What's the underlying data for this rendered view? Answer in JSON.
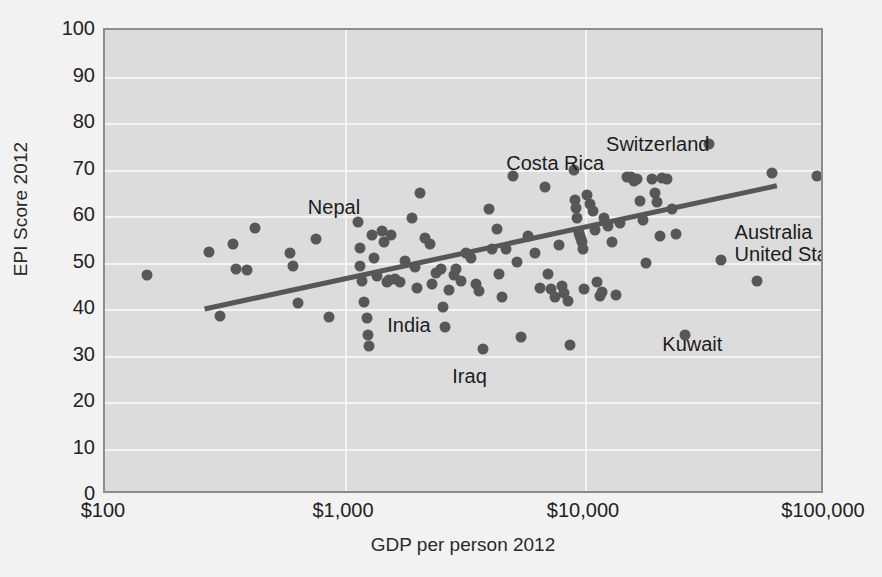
{
  "chart_data": {
    "type": "scatter",
    "title": "",
    "xlabel": "GDP per person 2012",
    "ylabel": "EPI Score 2012",
    "xscale": "log",
    "xlim": [
      100,
      100000
    ],
    "ylim": [
      0,
      100
    ],
    "grid": true,
    "legend": null,
    "xticks": [
      "$100",
      "$1,000",
      "$10,000",
      "$100,000"
    ],
    "xtick_values": [
      100,
      1000,
      10000,
      100000
    ],
    "yticks": [
      "0",
      "10",
      "20",
      "30",
      "40",
      "50",
      "60",
      "70",
      "80",
      "90",
      "100"
    ],
    "ytick_values": [
      0,
      10,
      20,
      30,
      40,
      50,
      60,
      70,
      80,
      90,
      100
    ],
    "marker_color": "#575757",
    "plot_background": "#dcdcdc",
    "gridline_color": "#f4f4f4",
    "trendline": {
      "color": "#575757",
      "x": [
        260,
        63000
      ],
      "y": [
        40.0,
        66.5
      ]
    },
    "annotations": [
      {
        "label": "Nepal",
        "x": 700,
        "y": 62.0,
        "align": "left"
      },
      {
        "label": "Costa Rica",
        "x": 4700,
        "y": 71.5,
        "align": "left"
      },
      {
        "label": "Switzerland",
        "x": 33000,
        "y": 75.5,
        "align": "right"
      },
      {
        "label": "Australia",
        "x": 42000,
        "y": 56.5,
        "align": "left"
      },
      {
        "label": "United States",
        "x": 42000,
        "y": 51.8,
        "align": "left"
      },
      {
        "label": "India",
        "x": 1500,
        "y": 36.5,
        "align": "left"
      },
      {
        "label": "Iraq",
        "x": 2800,
        "y": 25.5,
        "align": "left"
      },
      {
        "label": "Kuwait",
        "x": 21000,
        "y": 32.5,
        "align": "left"
      }
    ],
    "points": [
      {
        "x": 150,
        "y": 47.3
      },
      {
        "x": 270,
        "y": 52.3
      },
      {
        "x": 300,
        "y": 38.5
      },
      {
        "x": 340,
        "y": 54.0
      },
      {
        "x": 350,
        "y": 48.5
      },
      {
        "x": 390,
        "y": 48.3
      },
      {
        "x": 420,
        "y": 57.5
      },
      {
        "x": 590,
        "y": 52.0
      },
      {
        "x": 610,
        "y": 49.3
      },
      {
        "x": 640,
        "y": 41.2
      },
      {
        "x": 760,
        "y": 55.0
      },
      {
        "x": 860,
        "y": 38.3
      },
      {
        "x": 1130,
        "y": 58.7
      },
      {
        "x": 1150,
        "y": 53.1
      },
      {
        "x": 1160,
        "y": 49.2
      },
      {
        "x": 1180,
        "y": 46.0
      },
      {
        "x": 1200,
        "y": 41.6
      },
      {
        "x": 1230,
        "y": 38.0
      },
      {
        "x": 1250,
        "y": 34.5
      },
      {
        "x": 1260,
        "y": 32.0
      },
      {
        "x": 1290,
        "y": 55.9
      },
      {
        "x": 1320,
        "y": 51.0
      },
      {
        "x": 1360,
        "y": 47.2
      },
      {
        "x": 1420,
        "y": 56.8
      },
      {
        "x": 1450,
        "y": 54.4
      },
      {
        "x": 1500,
        "y": 45.7
      },
      {
        "x": 1530,
        "y": 46.2
      },
      {
        "x": 1560,
        "y": 56.0
      },
      {
        "x": 1620,
        "y": 46.5
      },
      {
        "x": 1700,
        "y": 45.9
      },
      {
        "x": 1780,
        "y": 50.3
      },
      {
        "x": 1900,
        "y": 59.5
      },
      {
        "x": 1950,
        "y": 49.0
      },
      {
        "x": 2000,
        "y": 44.6
      },
      {
        "x": 2050,
        "y": 64.9
      },
      {
        "x": 2150,
        "y": 55.2
      },
      {
        "x": 2250,
        "y": 54.0
      },
      {
        "x": 2300,
        "y": 45.3
      },
      {
        "x": 2400,
        "y": 47.8
      },
      {
        "x": 2500,
        "y": 48.5
      },
      {
        "x": 2550,
        "y": 40.5
      },
      {
        "x": 2600,
        "y": 36.2
      },
      {
        "x": 2700,
        "y": 44.0
      },
      {
        "x": 2850,
        "y": 47.3
      },
      {
        "x": 2900,
        "y": 48.7
      },
      {
        "x": 3050,
        "y": 46.1
      },
      {
        "x": 3200,
        "y": 52.1
      },
      {
        "x": 3350,
        "y": 51.0
      },
      {
        "x": 3500,
        "y": 45.3
      },
      {
        "x": 3600,
        "y": 43.8
      },
      {
        "x": 3750,
        "y": 31.5
      },
      {
        "x": 4000,
        "y": 61.5
      },
      {
        "x": 4100,
        "y": 52.9
      },
      {
        "x": 4300,
        "y": 57.1
      },
      {
        "x": 4400,
        "y": 47.5
      },
      {
        "x": 4500,
        "y": 42.6
      },
      {
        "x": 4700,
        "y": 53.0
      },
      {
        "x": 5000,
        "y": 68.7
      },
      {
        "x": 5200,
        "y": 50.2
      },
      {
        "x": 5400,
        "y": 34.0
      },
      {
        "x": 5800,
        "y": 55.7
      },
      {
        "x": 6200,
        "y": 52.0
      },
      {
        "x": 6500,
        "y": 44.5
      },
      {
        "x": 6800,
        "y": 66.3
      },
      {
        "x": 7000,
        "y": 47.6
      },
      {
        "x": 7200,
        "y": 44.2
      },
      {
        "x": 7500,
        "y": 42.5
      },
      {
        "x": 7800,
        "y": 53.8
      },
      {
        "x": 8000,
        "y": 45.0
      },
      {
        "x": 8200,
        "y": 43.5
      },
      {
        "x": 8500,
        "y": 41.8
      },
      {
        "x": 8700,
        "y": 32.2
      },
      {
        "x": 9000,
        "y": 69.8
      },
      {
        "x": 9100,
        "y": 63.5
      },
      {
        "x": 9200,
        "y": 61.8
      },
      {
        "x": 9300,
        "y": 59.5
      },
      {
        "x": 9400,
        "y": 56.4
      },
      {
        "x": 9500,
        "y": 55.6
      },
      {
        "x": 9600,
        "y": 55.0
      },
      {
        "x": 9700,
        "y": 54.4
      },
      {
        "x": 9800,
        "y": 52.8
      },
      {
        "x": 9900,
        "y": 44.3
      },
      {
        "x": 10200,
        "y": 64.6
      },
      {
        "x": 10500,
        "y": 62.6
      },
      {
        "x": 10800,
        "y": 61.0
      },
      {
        "x": 11000,
        "y": 57.0
      },
      {
        "x": 11200,
        "y": 45.8
      },
      {
        "x": 11500,
        "y": 42.8
      },
      {
        "x": 11800,
        "y": 43.6
      },
      {
        "x": 12000,
        "y": 59.6
      },
      {
        "x": 12500,
        "y": 57.8
      },
      {
        "x": 13000,
        "y": 54.4
      },
      {
        "x": 13500,
        "y": 43.0
      },
      {
        "x": 14000,
        "y": 58.5
      },
      {
        "x": 15000,
        "y": 68.3
      },
      {
        "x": 15500,
        "y": 68.4
      },
      {
        "x": 16000,
        "y": 67.6
      },
      {
        "x": 16500,
        "y": 67.9
      },
      {
        "x": 17000,
        "y": 63.2
      },
      {
        "x": 17500,
        "y": 59.2
      },
      {
        "x": 18000,
        "y": 50.0
      },
      {
        "x": 19000,
        "y": 68.0
      },
      {
        "x": 19500,
        "y": 64.9
      },
      {
        "x": 20000,
        "y": 63.0
      },
      {
        "x": 20500,
        "y": 55.8
      },
      {
        "x": 21000,
        "y": 68.2
      },
      {
        "x": 22000,
        "y": 67.9
      },
      {
        "x": 23000,
        "y": 61.5
      },
      {
        "x": 24000,
        "y": 56.2
      },
      {
        "x": 26000,
        "y": 34.5
      },
      {
        "x": 33000,
        "y": 75.5
      },
      {
        "x": 37000,
        "y": 50.5
      },
      {
        "x": 52000,
        "y": 46.0
      },
      {
        "x": 60000,
        "y": 69.3
      },
      {
        "x": 93000,
        "y": 68.5
      }
    ]
  }
}
